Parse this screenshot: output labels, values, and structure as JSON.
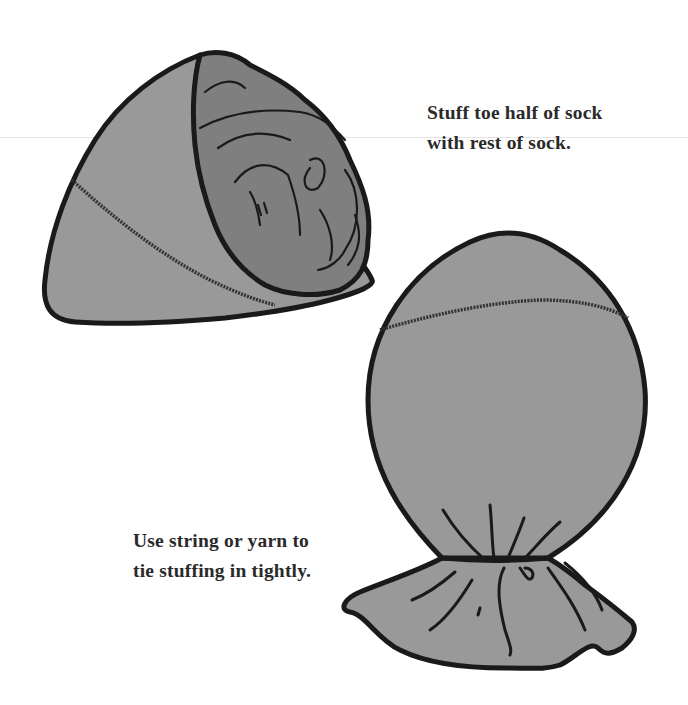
{
  "instructions": {
    "step_1": {
      "line_1": "Stuff toe half of sock",
      "line_2": "with rest of sock."
    },
    "step_2": {
      "line_1": "Use string or yarn to",
      "line_2": "tie stuffing in tightly."
    }
  },
  "illustrations": {
    "stuffed_sock": "sock-stuffed-icon",
    "tied_sock": "sock-tied-icon"
  },
  "colors": {
    "sock_fill": "#999999",
    "stuffing_fill": "#7f7f7f",
    "outline": "#1a1a1a",
    "text": "#2a2a2a",
    "background": "#ffffff"
  }
}
